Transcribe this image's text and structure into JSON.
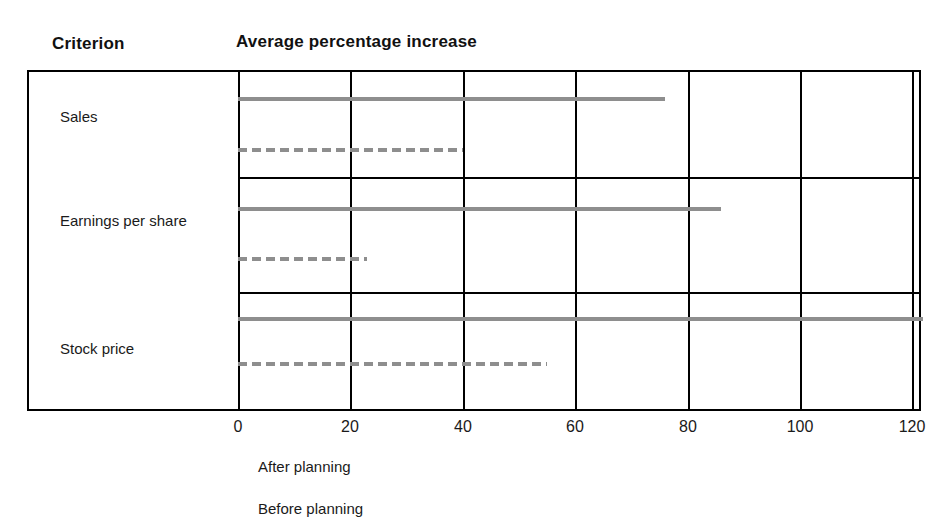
{
  "header": {
    "criterion_label": "Criterion",
    "value_label": "Average percentage increase"
  },
  "legend": {
    "after_label": "After planning",
    "before_label": "Before planning"
  },
  "colors": {
    "bar": "#8e8e8e",
    "frame": "#000000",
    "text": "#1a1a1a"
  },
  "chart_data": {
    "type": "bar",
    "title": "Average percentage increase",
    "xlabel": "",
    "ylabel": "Criterion",
    "xlim": [
      0,
      120
    ],
    "xticks": [
      0,
      20,
      40,
      60,
      80,
      100,
      120
    ],
    "xtick_labels": [
      "0",
      "20",
      "40",
      "60",
      "80",
      "100",
      "120"
    ],
    "grid": true,
    "legend_position": "below",
    "categories": [
      "Sales",
      "Earnings per share",
      "Stock price"
    ],
    "series": [
      {
        "name": "After planning",
        "style": "solid",
        "values": [
          76,
          86,
          122
        ]
      },
      {
        "name": "Before planning",
        "style": "dashed",
        "values": [
          40,
          23,
          55
        ]
      }
    ]
  }
}
